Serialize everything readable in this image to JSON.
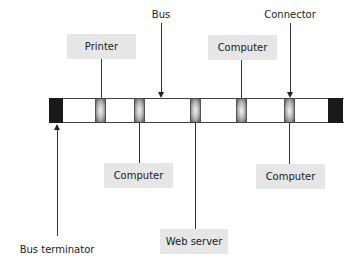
{
  "diagram": {
    "annotations": {
      "bus": "Bus",
      "connector": "Connector",
      "bus_terminator": "Bus terminator"
    },
    "nodes": [
      {
        "id": "printer",
        "label": "Printer",
        "side": "top"
      },
      {
        "id": "computer-top",
        "label": "Computer",
        "side": "top"
      },
      {
        "id": "computer-bottom-left",
        "label": "Computer",
        "side": "bottom"
      },
      {
        "id": "web-server",
        "label": "Web server",
        "side": "bottom"
      },
      {
        "id": "computer-bottom-right",
        "label": "Computer",
        "side": "bottom"
      }
    ],
    "colors": {
      "box_fill": "#e6e6e6",
      "terminator": "#1a1a1a",
      "line": "#333333"
    }
  }
}
